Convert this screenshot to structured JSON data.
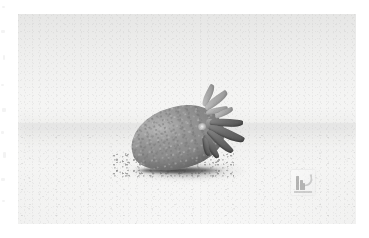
{
  "page": {
    "background_color": "#ffffff",
    "width": 369,
    "height": 238
  },
  "photo": {
    "alt_description": "Strawberry lying on its side on a pale surface",
    "subject": "strawberry",
    "treatment": "desaturated / near-grayscale",
    "frame": {
      "left": 18,
      "top": 14,
      "width": 338,
      "height": 210
    },
    "palette": {
      "background_top": "#e6e6e5",
      "background_mid": "#f6f6f5",
      "surface": "#f4f4f3",
      "berry_highlight": "#bababa",
      "berry_mid": "#8d8d8d",
      "berry_shadow": "#6f6f6f",
      "calyx_pale": "#a9a9a9",
      "calyx_dark": "#4e4e4e",
      "contact_shadow": "#606060"
    }
  },
  "watermark": {
    "name": "stock-photo-watermark",
    "position": {
      "left": 291,
      "top": 170,
      "width": 24,
      "height": 25
    },
    "color": "#8e8e8e",
    "opacity": "0.62"
  },
  "edge_artifacts": {
    "name": "scan-edge-artifacts",
    "side": "left",
    "color": "#d8d8d8"
  }
}
